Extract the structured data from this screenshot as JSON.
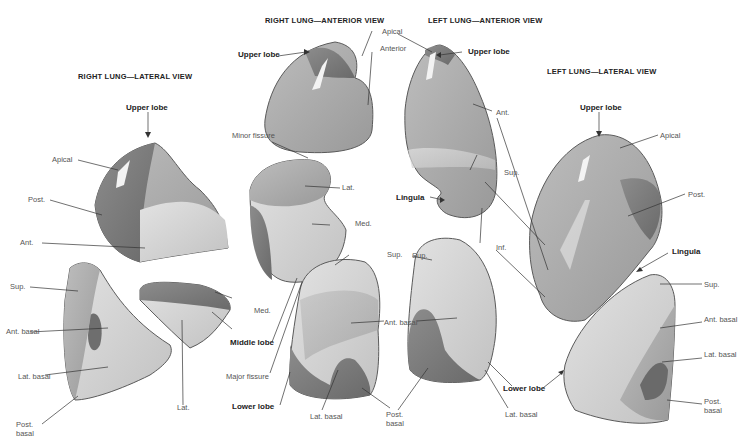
{
  "figure": {
    "views": [
      {
        "id": "right-lateral",
        "title": "RIGHT LUNG—LATERAL VIEW"
      },
      {
        "id": "right-anterior",
        "title": "RIGHT LUNG—ANTERIOR VIEW"
      },
      {
        "id": "left-anterior",
        "title": "LEFT LUNG—ANTERIOR VIEW"
      },
      {
        "id": "left-lateral",
        "title": "LEFT LUNG—LATERAL VIEW"
      }
    ],
    "labels": {
      "rl_upper_lobe": "Upper lobe",
      "rl_apical": "Apical",
      "rl_post": "Post.",
      "rl_ant": "Ant.",
      "rl_sup": "Sup.",
      "rl_ant_basal": "Ant. basal",
      "rl_lat_basal": "Lat. basal",
      "rl_post_basal": "Post. basal",
      "rl_lat": "Lat.",
      "ra_upper_lobe": "Upper lobe",
      "ra_apical": "Apical",
      "ra_anterior": "Anterior",
      "ra_minor_fissure": "Minor fissure",
      "ra_lat": "Lat.",
      "ra_med": "Med.",
      "ra_med2": "Med.",
      "ra_middle_lobe": "Middle lobe",
      "ra_major_fissure": "Major fissure",
      "ra_lower_lobe": "Lower lobe",
      "ra_sup": "Sup.",
      "ra_ant_basal": "Ant. basal",
      "ra_lat_basal": "Lat. basal",
      "ra_post_basal": "Post. basal",
      "la_upper_lobe": "Upper lobe",
      "la_ant": "Ant.",
      "la_sup": "Sup.",
      "la_lingula": "Lingula",
      "la_inf": "Inf.",
      "la_sup2": "Sup.",
      "la_lat_basal": "Lat. basal",
      "la_lower_lobe": "Lower lobe",
      "ll_upper_lobe": "Upper lobe",
      "ll_apical": "Apical",
      "ll_post": "Post.",
      "ll_lingula": "Lingula",
      "ll_sup": "Sup.",
      "ll_ant_basal": "Ant. basal",
      "ll_lat_basal": "Lat. basal",
      "ll_post_basal": "Post. basal"
    },
    "colors": {
      "lobe_dark": "#7a7a7a",
      "lobe_mid": "#a8a8a8",
      "lobe_light": "#d2d2d2",
      "lobe_outline": "#5a5a5a",
      "leader_line": "#333333"
    }
  }
}
